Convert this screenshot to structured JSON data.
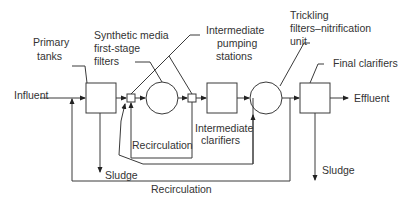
{
  "diagram": {
    "labels": {
      "influent": "Influent",
      "primary_tanks_1": "Primary",
      "primary_tanks_2": "tanks",
      "synthetic_1": "Synthetic media",
      "synthetic_2": "first-stage",
      "synthetic_3": "filters",
      "pumping_1": "Intermediate",
      "pumping_2": "pumping",
      "pumping_3": "stations",
      "trickling_1": "Trickling",
      "trickling_2": "filters–nitrification",
      "trickling_3": "unit",
      "final_clarifiers": "Final clarifiers",
      "effluent": "Effluent",
      "recirculation_inner": "Recirculation",
      "intermediate_clarifiers_1": "Intermediate",
      "intermediate_clarifiers_2": "clarifiers",
      "sludge_left": "Sludge",
      "sludge_right": "Sludge",
      "recirculation_outer": "Recirculation"
    },
    "colors": {
      "line": "#3a3a3a",
      "text": "#333333",
      "background": "#ffffff"
    }
  }
}
